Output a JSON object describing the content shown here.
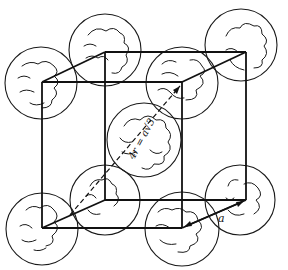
{
  "diagram": {
    "type": "body-centered cubic unit cell",
    "labels": {
      "edge": "a",
      "body_diagonal": "4r = a√3"
    },
    "colors": {
      "line": "#111111",
      "background": "#ffffff"
    },
    "atoms": [
      {
        "id": "back-top-left",
        "cx": 105,
        "cy": 50,
        "r": 36
      },
      {
        "id": "back-top-right",
        "cx": 241,
        "cy": 45,
        "r": 36
      },
      {
        "id": "front-top-left",
        "cx": 41,
        "cy": 83,
        "r": 36
      },
      {
        "id": "front-top-right",
        "cx": 182,
        "cy": 83,
        "r": 36
      },
      {
        "id": "body-center",
        "cx": 144,
        "cy": 140,
        "r": 37
      },
      {
        "id": "back-bottom-left",
        "cx": 105,
        "cy": 200,
        "r": 35
      },
      {
        "id": "back-bottom-right",
        "cx": 240,
        "cy": 200,
        "r": 35
      },
      {
        "id": "front-bottom-left",
        "cx": 42,
        "cy": 229,
        "r": 36
      },
      {
        "id": "front-bottom-right",
        "cx": 182,
        "cy": 229,
        "r": 37
      }
    ]
  }
}
